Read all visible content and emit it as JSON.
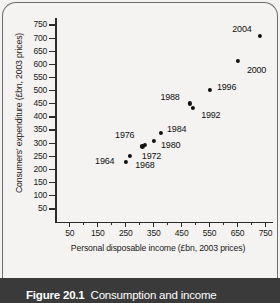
{
  "figure": {
    "caption_number": "Figure 20.1",
    "caption_title": "Consumption and income"
  },
  "chart_data": {
    "type": "scatter",
    "title": "",
    "xlabel": "Personal disposable income (£bn, 2003 prices)",
    "ylabel": "Consumers' expenditure (£bn, 2003 prices)",
    "xlim": [
      0,
      775
    ],
    "ylim": [
      0,
      775
    ],
    "xticks": [
      50,
      150,
      250,
      350,
      450,
      550,
      650,
      750
    ],
    "xminor_ticks": [
      100,
      200,
      300,
      400,
      500,
      600,
      700
    ],
    "yticks": [
      50,
      100,
      150,
      200,
      250,
      300,
      350,
      400,
      450,
      500,
      550,
      600,
      650,
      700,
      750
    ],
    "grid": false,
    "legend": "none",
    "point_color": "#111111",
    "points": [
      {
        "label": "1964",
        "x": 250,
        "y": 230,
        "label_pos": "left"
      },
      {
        "label": "1968",
        "x": 265,
        "y": 253,
        "label_pos": "right-below"
      },
      {
        "label": "1972",
        "x": 310,
        "y": 288,
        "label_pos": "below-right"
      },
      {
        "label": "1976",
        "x": 318,
        "y": 295,
        "label_pos": "left-above"
      },
      {
        "label": "1980",
        "x": 350,
        "y": 310,
        "label_pos": "right"
      },
      {
        "label": "1984",
        "x": 375,
        "y": 340,
        "label_pos": "right"
      },
      {
        "label": "1988",
        "x": 480,
        "y": 452,
        "label_pos": "left"
      },
      {
        "label": "1992",
        "x": 490,
        "y": 435,
        "label_pos": "right-below"
      },
      {
        "label": "1996",
        "x": 550,
        "y": 503,
        "label_pos": "right"
      },
      {
        "label": "2000",
        "x": 650,
        "y": 615,
        "label_pos": "right-below"
      },
      {
        "label": "2004",
        "x": 730,
        "y": 710,
        "label_pos": "left"
      }
    ]
  }
}
